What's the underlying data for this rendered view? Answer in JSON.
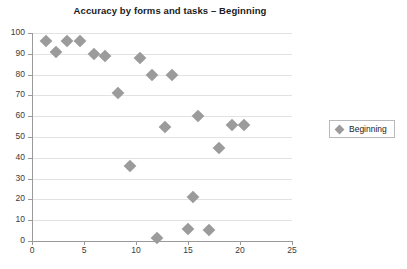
{
  "chart_data": {
    "type": "scatter",
    "title": "Accuracy by forms and tasks – Beginning",
    "xlabel": "",
    "ylabel": "",
    "xlim": [
      0,
      25
    ],
    "ylim": [
      0,
      100
    ],
    "xticks": [
      0,
      5,
      10,
      15,
      20,
      25
    ],
    "yticks": [
      0,
      10,
      20,
      30,
      40,
      50,
      60,
      70,
      80,
      90,
      100
    ],
    "grid": "horizontal",
    "legend_position": "right",
    "marker": "diamond",
    "marker_color": "#9b9b9b",
    "series": [
      {
        "name": "Beginning",
        "points": [
          [
            1.3,
            96
          ],
          [
            2.3,
            91
          ],
          [
            3.4,
            96
          ],
          [
            4.6,
            96
          ],
          [
            6.0,
            90
          ],
          [
            7.0,
            89
          ],
          [
            8.3,
            71
          ],
          [
            9.4,
            36
          ],
          [
            10.4,
            88
          ],
          [
            11.5,
            80
          ],
          [
            12.0,
            1.5
          ],
          [
            12.8,
            55
          ],
          [
            13.5,
            80
          ],
          [
            15.0,
            6
          ],
          [
            15.5,
            21
          ],
          [
            16.0,
            60
          ],
          [
            17.0,
            5.5
          ],
          [
            18.0,
            44.5
          ],
          [
            19.2,
            56
          ],
          [
            20.4,
            56
          ]
        ]
      }
    ]
  },
  "legend": {
    "entries": [
      {
        "label": "Beginning",
        "marker_icon": "diamond-marker-icon"
      }
    ]
  }
}
